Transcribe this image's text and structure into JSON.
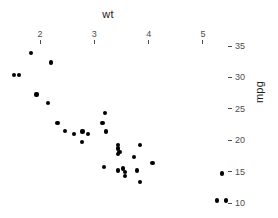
{
  "chart_data": {
    "type": "scatter",
    "title": "",
    "xlabel": "wt",
    "ylabel": "mpg",
    "xlim": [
      1.3,
      5.6
    ],
    "ylim": [
      9.0,
      35.5
    ],
    "xticks": [
      2,
      3,
      4,
      5
    ],
    "xticklabels": [
      "2",
      "3",
      "4",
      "5"
    ],
    "yticks": [
      35,
      30,
      25,
      20,
      15,
      10
    ],
    "yticklabels": [
      "35",
      "30",
      "25",
      "20",
      "15",
      "10"
    ],
    "x_axis_position": "top",
    "y_axis_position": "right",
    "grid": false,
    "legend": null,
    "point_color": "#000000",
    "point_size": 4,
    "x": [
      2.62,
      2.875,
      2.32,
      3.215,
      3.44,
      3.46,
      3.57,
      3.19,
      3.15,
      3.44,
      3.44,
      4.07,
      3.73,
      3.78,
      5.25,
      5.424,
      5.345,
      2.2,
      1.615,
      1.835,
      2.465,
      3.52,
      3.435,
      3.84,
      3.845,
      1.935,
      2.14,
      1.513,
      3.17,
      2.77,
      3.57,
      2.78
    ],
    "y": [
      21.0,
      21.0,
      22.8,
      21.4,
      18.7,
      18.1,
      14.3,
      24.4,
      22.8,
      19.2,
      17.8,
      16.4,
      17.3,
      15.2,
      10.4,
      10.4,
      14.7,
      32.4,
      30.4,
      33.9,
      21.5,
      15.5,
      15.2,
      13.3,
      19.2,
      27.3,
      26.0,
      30.4,
      15.8,
      19.7,
      15.0,
      21.4
    ]
  },
  "axis": {
    "x_title": "wt",
    "y_title": "mpg"
  }
}
